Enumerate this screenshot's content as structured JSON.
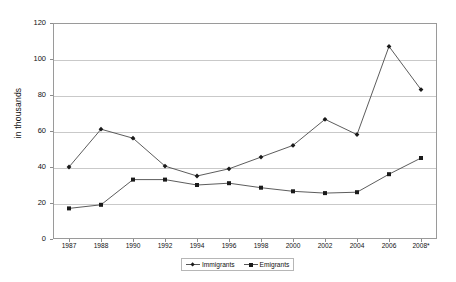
{
  "chart_data": {
    "type": "line",
    "title": "",
    "subtitle": "",
    "xlabel": "",
    "ylabel": "in thousands",
    "categories": [
      "1987",
      "1988",
      "1990",
      "1992",
      "1994",
      "1996",
      "1998",
      "2000",
      "2002",
      "2004",
      "2006",
      "2008*"
    ],
    "series": [
      {
        "name": "Immigrants",
        "marker": "diamond",
        "color": "#4a4a4a",
        "values": [
          40,
          61,
          56,
          40.5,
          35,
          39,
          45.5,
          52,
          66.5,
          58,
          107,
          83
        ]
      },
      {
        "name": "Emigrants",
        "marker": "square",
        "color": "#4a4a4a",
        "values": [
          17,
          19,
          33,
          33,
          30,
          31,
          28.5,
          26.5,
          25.5,
          26,
          36,
          45
        ]
      }
    ],
    "ylim": [
      0,
      120
    ],
    "yticks": [
      0,
      20,
      40,
      60,
      80,
      100,
      120
    ],
    "ytick_labels": [
      "0",
      "20",
      "40",
      "60",
      "80",
      "100",
      "120"
    ],
    "grid": true,
    "grid_axis": "y",
    "legend_position": "bottom",
    "legend_entries": [
      "Immigrants",
      "Emigrants"
    ],
    "footnote": "",
    "annotations": []
  },
  "colors": {
    "background": "#ffffff",
    "gridline": "#c9c9c9",
    "frame": "#9a9a9a",
    "series_line": "#4a4a4a",
    "marker": "#1a1a1a",
    "text": "#111111"
  }
}
